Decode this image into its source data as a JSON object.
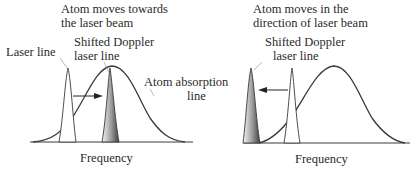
{
  "panels": [
    {
      "title_line1": "Atom moves towards",
      "title_line2": "the laser beam",
      "laser_label": "Laser line",
      "shifted_label_line1": "Shifted Doppler",
      "shifted_label_line2": "laser line",
      "absorption_label_line1": "Atom absorption",
      "absorption_label_line2": "line",
      "xaxis_label": "Frequency",
      "shift_direction": "right"
    },
    {
      "title_line1": "Atom moves in the",
      "title_line2": "direction of laser beam",
      "shifted_label_line1": "Shifted Doppler",
      "shifted_label_line2": "laser line",
      "xaxis_label": "Frequency",
      "shift_direction": "left"
    }
  ],
  "colors": {
    "line": "#3a3a3a",
    "shifted_fill_dark": "#555555",
    "shifted_fill_light": "#f2f2f2"
  }
}
